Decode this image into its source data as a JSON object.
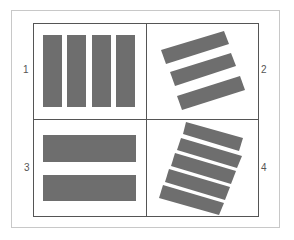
{
  "diagram": {
    "quadrants": [
      {
        "label": "1",
        "description": "4 vertical bars"
      },
      {
        "label": "2",
        "description": "3 tilted bars"
      },
      {
        "label": "3",
        "description": "2 horizontal bars"
      },
      {
        "label": "4",
        "description": "5 tilted bars"
      }
    ],
    "colors": {
      "bar": "#6e6e6e",
      "grid": "#555555",
      "frame": "#c8c8c8"
    }
  }
}
